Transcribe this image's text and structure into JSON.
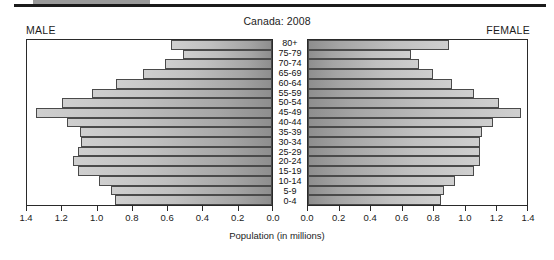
{
  "top_rule": {
    "present": true
  },
  "chart_data": {
    "type": "bar",
    "subtype": "population-pyramid",
    "title": "Canada: 2008",
    "xlabel": "Population (in millions)",
    "ylabel": "",
    "grid": false,
    "legend_position": "none",
    "left_panel_label": "MALE",
    "right_panel_label": "FEMALE",
    "xlim_left": [
      1.4,
      0.0
    ],
    "xlim_right": [
      0.0,
      1.4
    ],
    "xticks_left": [
      "1.4",
      "1.2",
      "1.0",
      "0.8",
      "0.6",
      "0.4",
      "0.2",
      "0.0"
    ],
    "xticks_right": [
      "0.0",
      "0.2",
      "0.4",
      "0.6",
      "0.8",
      "1.0",
      "1.2",
      "1.4"
    ],
    "xtick_values": [
      0.0,
      0.2,
      0.4,
      0.6,
      0.8,
      1.0,
      1.2,
      1.4
    ],
    "categories": [
      "80+",
      "75-79",
      "70-74",
      "65-69",
      "60-64",
      "55-59",
      "50-54",
      "45-49",
      "40-44",
      "35-39",
      "30-34",
      "25-29",
      "20-24",
      "15-19",
      "10-14",
      "5-9",
      "0-4"
    ],
    "series": [
      {
        "name": "MALE",
        "side": "left",
        "values": [
          0.58,
          0.51,
          0.61,
          0.74,
          0.89,
          1.03,
          1.2,
          1.35,
          1.17,
          1.1,
          1.09,
          1.11,
          1.14,
          1.11,
          0.99,
          0.92,
          0.9
        ]
      },
      {
        "name": "FEMALE",
        "side": "right",
        "values": [
          0.9,
          0.66,
          0.71,
          0.8,
          0.92,
          1.06,
          1.22,
          1.36,
          1.18,
          1.11,
          1.1,
          1.1,
          1.1,
          1.06,
          0.94,
          0.87,
          0.85
        ]
      }
    ]
  },
  "colors": {
    "bar_dark": "#8e8e8e",
    "bar_light": "#cfcfcf",
    "bar_edge": "#4a4a4a",
    "axis": "#2a2a2a",
    "text": "#1c1c1c",
    "rule": "#1b1b1b",
    "rule_swatch": "#9a9a9a"
  }
}
